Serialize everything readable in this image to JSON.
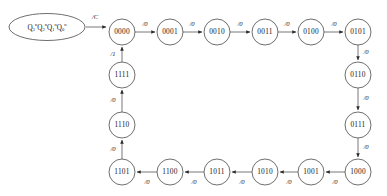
{
  "diagram": {
    "type": "state-transition-diagram",
    "title_register": {
      "segments": [
        {
          "base": "Q",
          "sub": "3",
          "sup": "n"
        },
        {
          "base": "Q",
          "sub": "2",
          "sup": "n"
        },
        {
          "base": "Q",
          "sub": "1",
          "sup": "n"
        },
        {
          "base": "Q",
          "sub": "0",
          "sup": "n"
        }
      ],
      "plain": "Q3nQ2nQ1nQ0n"
    },
    "start_arrow_label": "/C",
    "colors": {
      "node_stroke": "#4a4a4a",
      "edge_stroke": "#6a6a6a",
      "arrowhead": "#2a2a2a",
      "text": "#1a1a1a",
      "background": "#ffffff"
    },
    "nodes": [
      {
        "id": "s0",
        "label": "0000",
        "cx": 122,
        "cy": 32,
        "r": 13
      },
      {
        "id": "s1",
        "label": "0001",
        "cx": 170,
        "cy": 32,
        "r": 13
      },
      {
        "id": "s2",
        "label": "0010",
        "cx": 217,
        "cy": 32,
        "r": 13
      },
      {
        "id": "s3",
        "label": "0011",
        "cx": 265,
        "cy": 32,
        "r": 13
      },
      {
        "id": "s4",
        "label": "0100",
        "cx": 311,
        "cy": 32,
        "r": 13
      },
      {
        "id": "s5",
        "label": "0101",
        "cx": 358,
        "cy": 32,
        "r": 13
      },
      {
        "id": "s6",
        "label": "0110",
        "cx": 358,
        "cy": 75,
        "r": 13
      },
      {
        "id": "s7",
        "label": "0111",
        "cx": 358,
        "cy": 125,
        "r": 13
      },
      {
        "id": "s8",
        "label": "1000",
        "cx": 358,
        "cy": 172,
        "r": 13
      },
      {
        "id": "s9",
        "label": "1001",
        "cx": 311,
        "cy": 172,
        "r": 13
      },
      {
        "id": "s10",
        "label": "1010",
        "cx": 265,
        "cy": 172,
        "r": 13
      },
      {
        "id": "s11",
        "label": "1011",
        "cx": 217,
        "cy": 172,
        "r": 13
      },
      {
        "id": "s12",
        "label": "1100",
        "cx": 170,
        "cy": 172,
        "r": 13
      },
      {
        "id": "s13",
        "label": "1101",
        "cx": 122,
        "cy": 172,
        "r": 13
      },
      {
        "id": "s14",
        "label": "1110",
        "cx": 122,
        "cy": 125,
        "r": 13
      },
      {
        "id": "s15",
        "label": "1111",
        "cx": 122,
        "cy": 75,
        "r": 13
      }
    ],
    "transitions": [
      {
        "from": "0000",
        "to": "0001",
        "label": "/0"
      },
      {
        "from": "0001",
        "to": "0010",
        "label": "/0"
      },
      {
        "from": "0010",
        "to": "0011",
        "label": "/0"
      },
      {
        "from": "0011",
        "to": "0100",
        "label": "/0"
      },
      {
        "from": "0100",
        "to": "0101",
        "label": "/0"
      },
      {
        "from": "0101",
        "to": "0110",
        "label": "/0"
      },
      {
        "from": "0110",
        "to": "0111",
        "label": "/0"
      },
      {
        "from": "0111",
        "to": "1000",
        "label": "/0"
      },
      {
        "from": "1000",
        "to": "1001",
        "label": "/0"
      },
      {
        "from": "1001",
        "to": "1010",
        "label": "/0"
      },
      {
        "from": "1010",
        "to": "1011",
        "label": "/0"
      },
      {
        "from": "1011",
        "to": "1100",
        "label": "/0"
      },
      {
        "from": "1100",
        "to": "1101",
        "label": "/0"
      },
      {
        "from": "1101",
        "to": "1110",
        "label": "/0"
      },
      {
        "from": "1110",
        "to": "1111",
        "label": "/0"
      },
      {
        "from": "1111",
        "to": "0000",
        "label": "/1"
      }
    ],
    "edge_labels": {
      "e_0000_0001": "/0",
      "e_0001_0010": "/0",
      "e_0010_0011": "/0",
      "e_0011_0100": "/0",
      "e_0100_0101": "/0",
      "e_0101_0110": "/0",
      "e_0110_0111": "/0",
      "e_0111_1000": "/0",
      "e_1000_1001": "/0",
      "e_1001_1010": "/0",
      "e_1010_1011": "/0",
      "e_1011_1100": "/0",
      "e_1100_1101": "/0",
      "e_1101_1110": "/0",
      "e_1110_1111": "/0",
      "e_1111_0000": "/1"
    }
  }
}
